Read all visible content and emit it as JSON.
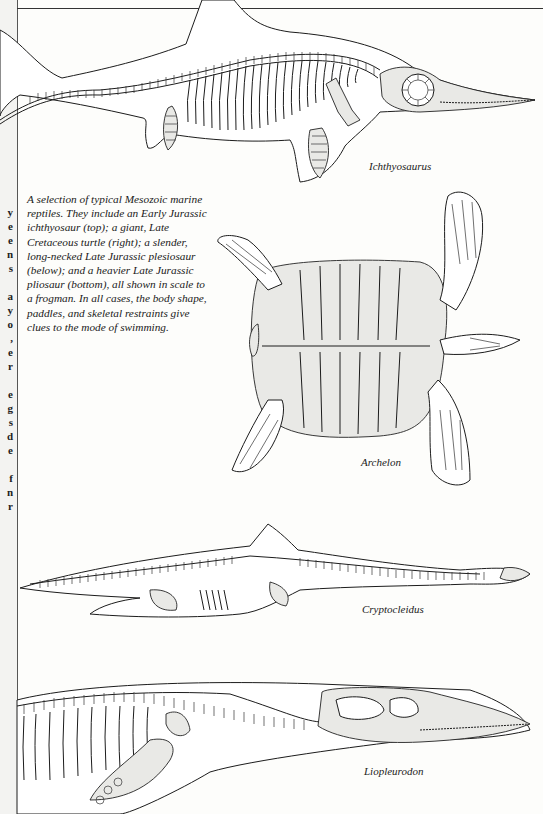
{
  "page": {
    "caption": "A selection of typical Mesozoic marine reptiles. They include an Early Jurassic ichthyosaur (top); a giant, Late Cretaceous turtle (right); a slender, long-necked Late Jurassic plesiosaur (below); and a heavier Late Jurassic pliosaur (bottom), all shown in scale to a frogman. In all cases, the body shape, paddles, and skeletal restraints give clues to the mode of swimming.",
    "left_page_fragments": [
      "y",
      "e",
      "e",
      "n",
      "s",
      "",
      "a",
      "y",
      "o",
      "",
      ",",
      "e",
      "r",
      "",
      "e",
      "g",
      "s",
      "d",
      "e",
      "",
      "f",
      "n",
      "r"
    ]
  },
  "illustrations": [
    {
      "name": "ichthyosaurus",
      "label": "Ichthyosaurus"
    },
    {
      "name": "archelon",
      "label": "Archelon"
    },
    {
      "name": "cryptocleidus",
      "label": "Cryptocleidus"
    },
    {
      "name": "liopleurodon",
      "label": "Liopleurodon"
    }
  ]
}
